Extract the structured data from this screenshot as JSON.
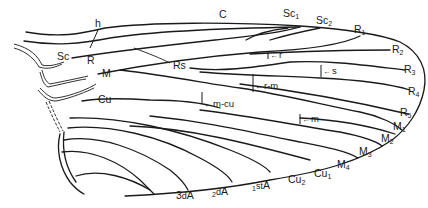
{
  "diagram": {
    "type": "insect-wing-venation",
    "longitudinal_veins": {
      "costa": "C",
      "subcosta": "Sc",
      "subcosta_branches": [
        {
          "base": "Sc",
          "sub": "1"
        },
        {
          "base": "Sc",
          "sub": "2"
        }
      ],
      "radius": "R",
      "radial_sector": "Rs",
      "radius_branches": [
        {
          "base": "R",
          "sub": "1"
        },
        {
          "base": "R",
          "sub": "2"
        },
        {
          "base": "R",
          "sub": "3"
        },
        {
          "base": "R",
          "sub": "4"
        },
        {
          "base": "R",
          "sub": "5"
        }
      ],
      "media": "M",
      "media_branches": [
        {
          "base": "M",
          "sub": "1"
        },
        {
          "base": "M",
          "sub": "2"
        },
        {
          "base": "M",
          "sub": "3"
        },
        {
          "base": "M",
          "sub": "4"
        }
      ],
      "cubitus": "Cu",
      "cubitus_branches": [
        {
          "base": "Cu",
          "sub": "1"
        },
        {
          "base": "Cu",
          "sub": "2"
        }
      ],
      "anal_veins": [
        {
          "prefix": "1",
          "ord": "st",
          "base": "A"
        },
        {
          "prefix": "2",
          "ord": "d",
          "base": "A"
        },
        {
          "prefix": "3",
          "ord": "d",
          "base": "A"
        }
      ]
    },
    "cross_veins": {
      "humeral": "h",
      "radial": "r",
      "sectorial": "s",
      "radio_medial": "r-m",
      "medial": "m",
      "medio_cubital": "m-cu"
    },
    "arrow_glyph": "←"
  }
}
